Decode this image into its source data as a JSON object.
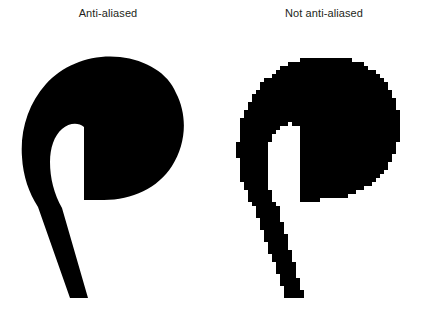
{
  "figure": {
    "background_color": "#ffffff",
    "text_color": "#231f20",
    "shape_color": "#000000",
    "width": 432,
    "height": 312
  },
  "panels": [
    {
      "id": "anti-aliased",
      "caption": "Anti-aliased",
      "edge_style": "smooth",
      "description": "Glyph rendered with anti-aliasing: edges blend to gray"
    },
    {
      "id": "not-anti-aliased",
      "caption": "Not anti-aliased",
      "edge_style": "jagged",
      "description": "Glyph rendered without anti-aliasing: hard blocky stair-step edges"
    }
  ],
  "glyph": {
    "name": "spiral-comma-glyph",
    "path": "M 176 63 C 168 43 146 30 120 27 C 92 24 64 34 46 54 C 28 74 20 101 22 127 C 23 146 29 163 38 177 L 70 268 L 88 268 L 62 178 C 54 164 50 148 50 132 C 50 118 54 106 62 99 C 69 93 78 92 84 97 L 84 170 L 104 170 C 132 170 158 158 172 136 C 186 114 188 86 176 63 Z"
  }
}
